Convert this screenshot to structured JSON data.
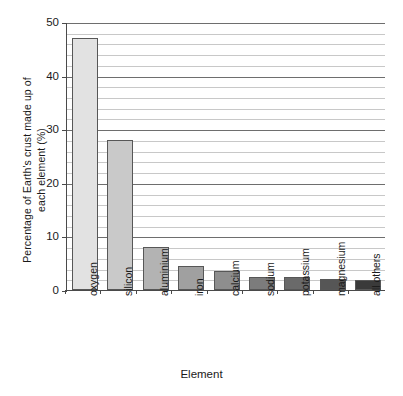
{
  "chart_data": {
    "type": "bar",
    "title": "",
    "xlabel": "Element",
    "ylabel_lines": [
      "Percentage of Earth's crust made up of",
      "each element (%)"
    ],
    "ylabel": "Percentage of Earth's crust made up of each element (%)",
    "categories": [
      "oxygen",
      "silicon",
      "aluminium",
      "iron",
      "calcium",
      "sodium",
      "potassium",
      "magnesium",
      "all others"
    ],
    "values": [
      47,
      28,
      8,
      4.5,
      3.5,
      2.5,
      2.4,
      2.1,
      1.8
    ],
    "bar_colors": [
      "#e2e2e2",
      "#c9c9c9",
      "#b3b3b3",
      "#a0a0a0",
      "#8e8e8e",
      "#7c7c7c",
      "#6a6a6a",
      "#565656",
      "#3a3a3a"
    ],
    "ylim": [
      0,
      50
    ],
    "ytick_labels": [
      "0",
      "10",
      "20",
      "30",
      "40",
      "50"
    ],
    "ytick_values": [
      0,
      10,
      20,
      30,
      40,
      50
    ],
    "minor_tick_step": 2,
    "grid": "horizontal",
    "legend": "none",
    "axis_color": "#4a4a4a",
    "grid_major_color": "#6e6e6e",
    "grid_minor_color": "#c8c8c8"
  }
}
